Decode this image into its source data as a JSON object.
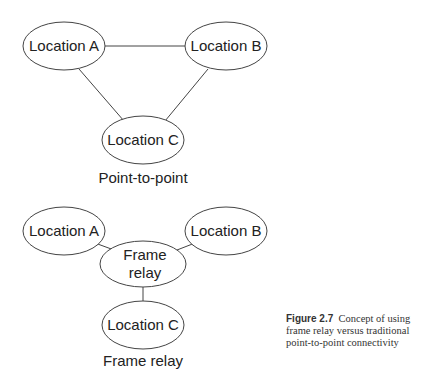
{
  "diagrams": [
    {
      "title": "Point-to-point",
      "nodes": [
        {
          "id": "A",
          "label": "Location A"
        },
        {
          "id": "B",
          "label": "Location B"
        },
        {
          "id": "C",
          "label": "Location C"
        }
      ],
      "edges": [
        [
          "A",
          "B"
        ],
        [
          "A",
          "C"
        ],
        [
          "B",
          "C"
        ]
      ]
    },
    {
      "title": "Frame relay",
      "nodes": [
        {
          "id": "A",
          "label": "Location A"
        },
        {
          "id": "B",
          "label": "Location B"
        },
        {
          "id": "FR",
          "label_line1": "Frame",
          "label_line2": "relay"
        },
        {
          "id": "C",
          "label": "Location C"
        }
      ],
      "edges": [
        [
          "A",
          "FR"
        ],
        [
          "B",
          "FR"
        ],
        [
          "C",
          "FR"
        ]
      ]
    }
  ],
  "caption": {
    "figure_label": "Figure 2.7",
    "text": "Concept of using frame relay versus traditional point-to-point connectivity"
  }
}
